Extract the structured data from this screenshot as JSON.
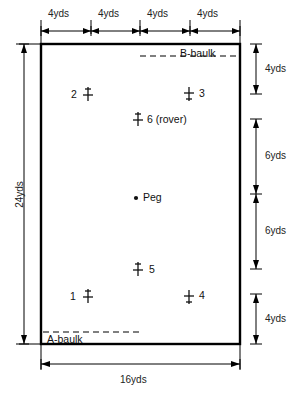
{
  "diagram": {
    "court": {
      "width_label": "16yds",
      "height_label": "24yds",
      "border_color": "#000000",
      "fill_color": "#ffffff"
    },
    "top_dimensions": [
      "4yds",
      "4yds",
      "4yds",
      "4yds"
    ],
    "right_dimensions": [
      "4yds",
      "6yds",
      "6yds",
      "4yds"
    ],
    "baulks": [
      {
        "name": "B-baulk",
        "label": "B-baulk",
        "position": "top"
      },
      {
        "name": "A-baulk",
        "label": "A-baulk",
        "position": "bottom"
      }
    ],
    "peg": {
      "label": "Peg"
    },
    "hoops": [
      {
        "id": "1",
        "label": "1",
        "label_side": "left"
      },
      {
        "id": "2",
        "label": "2",
        "label_side": "left"
      },
      {
        "id": "3",
        "label": "3",
        "label_side": "right"
      },
      {
        "id": "4",
        "label": "4",
        "label_side": "right"
      },
      {
        "id": "5",
        "label": "5",
        "label_side": "right"
      },
      {
        "id": "6",
        "label": "6 (rover)",
        "label_side": "right"
      }
    ]
  }
}
